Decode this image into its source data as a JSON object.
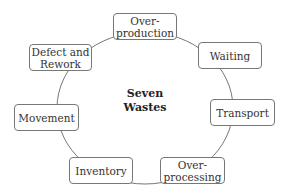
{
  "diagram": {
    "type": "cycle",
    "center_label_line1": "Seven",
    "center_label_line2": "Wastes",
    "nodes": [
      {
        "line1": "Over-",
        "line2": "production"
      },
      {
        "line1": "Waiting",
        "line2": ""
      },
      {
        "line1": "Transport",
        "line2": ""
      },
      {
        "line1": "Over-",
        "line2": "processing"
      },
      {
        "line1": "Inventory",
        "line2": ""
      },
      {
        "line1": "Movement",
        "line2": ""
      },
      {
        "line1": "Defect and",
        "line2": "Rework"
      }
    ],
    "colors": {
      "stroke": "#777777",
      "text": "#333333",
      "background": "#ffffff"
    }
  }
}
